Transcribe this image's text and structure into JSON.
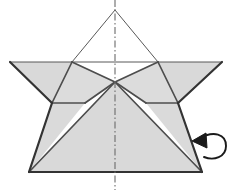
{
  "figure": {
    "title": "Origami fold diagram",
    "canvas": {
      "width": 246,
      "height": 193
    },
    "style": {
      "paper_fill": "#d9d9d9",
      "paper_fill_light": "#e2e2e2",
      "white_fill": "#ffffff",
      "outline_color": "#3a3a3a",
      "edge_color": "#4a4a4a",
      "crease_color": "#555555",
      "axis_color": "#666666",
      "arrow_color": "#1a1a1a",
      "outline_width": 2.1,
      "crease_width": 1.6,
      "thin_width": 1.0,
      "axis_width": 1.1,
      "axis_dash": "7,2.5,1.5,2.5"
    },
    "geometry": {
      "apex": [
        115,
        10
      ],
      "left_wing_tip": [
        10,
        62
      ],
      "right_wing_tip": [
        222,
        62
      ],
      "left_shoulder": [
        72,
        62
      ],
      "right_shoulder": [
        158,
        62
      ],
      "left_notch": [
        52,
        103
      ],
      "right_notch": [
        178,
        103
      ],
      "center_valley": [
        115,
        82
      ],
      "bottom_left": [
        29,
        172
      ],
      "bottom_right": [
        202,
        172
      ],
      "horizon_y": 62,
      "waist_y": 103,
      "base_y": 172,
      "axis_x": 115,
      "axis_top": 0,
      "axis_bottom": 190
    },
    "shapes": [
      {
        "name": "left-wing-panel",
        "points": "10,62 72,62 52,103",
        "fill": "#d9d9d9"
      },
      {
        "name": "right-wing-panel",
        "points": "222,62 158,62 178,103",
        "fill": "#d9d9d9"
      },
      {
        "name": "left-upper-flap",
        "points": "72,62 115,82 85,103 52,103",
        "fill": "#d9d9d9"
      },
      {
        "name": "right-upper-flap",
        "points": "158,62 115,82 146,103 178,103",
        "fill": "#d9d9d9"
      },
      {
        "name": "left-lower-panel",
        "points": "52,103 85,103 29,172",
        "fill": "#d9d9d9"
      },
      {
        "name": "right-lower-panel",
        "points": "178,103 146,103 202,172",
        "fill": "#d9d9d9"
      },
      {
        "name": "center-body-triangle",
        "points": "115,82 202,172 29,172",
        "fill": "#d9d9d9"
      },
      {
        "name": "top-white-flap",
        "points": "115,10 158,62 72,62",
        "fill": "#ffffff"
      },
      {
        "name": "center-white-notch",
        "points": "72,62 158,62 115,82",
        "fill": "#ffffff"
      }
    ],
    "creases": [
      {
        "name": "apex-left-edge",
        "from": [
          115,
          10
        ],
        "to": [
          72,
          62
        ],
        "weight": "thin"
      },
      {
        "name": "apex-right-edge",
        "from": [
          115,
          10
        ],
        "to": [
          158,
          62
        ],
        "weight": "thin"
      },
      {
        "name": "horizon-line",
        "from": [
          10,
          62
        ],
        "to": [
          222,
          62
        ],
        "weight": "thin"
      },
      {
        "name": "left-wing-lower-edge",
        "from": [
          10,
          62
        ],
        "to": [
          52,
          103
        ],
        "weight": "outline"
      },
      {
        "name": "right-wing-lower-edge",
        "from": [
          222,
          62
        ],
        "to": [
          178,
          103
        ],
        "weight": "outline"
      },
      {
        "name": "left-shoulder-to-notch",
        "from": [
          72,
          62
        ],
        "to": [
          52,
          103
        ],
        "weight": "crease"
      },
      {
        "name": "right-shoulder-to-notch",
        "from": [
          158,
          62
        ],
        "to": [
          178,
          103
        ],
        "weight": "crease"
      },
      {
        "name": "left-valley-fold",
        "from": [
          72,
          62
        ],
        "to": [
          115,
          82
        ],
        "weight": "crease"
      },
      {
        "name": "right-valley-fold",
        "from": [
          158,
          62
        ],
        "to": [
          115,
          82
        ],
        "weight": "crease"
      },
      {
        "name": "left-inner-diagonal",
        "from": [
          115,
          82
        ],
        "to": [
          85,
          103
        ],
        "weight": "crease"
      },
      {
        "name": "right-inner-diagonal",
        "from": [
          115,
          82
        ],
        "to": [
          146,
          103
        ],
        "weight": "crease"
      },
      {
        "name": "left-waist-line",
        "from": [
          52,
          103
        ],
        "to": [
          85,
          103
        ],
        "weight": "crease"
      },
      {
        "name": "right-waist-line",
        "from": [
          178,
          103
        ],
        "to": [
          146,
          103
        ],
        "weight": "crease"
      },
      {
        "name": "left-body-edge",
        "from": [
          115,
          82
        ],
        "to": [
          29,
          172
        ],
        "weight": "crease"
      },
      {
        "name": "right-body-edge",
        "from": [
          115,
          82
        ],
        "to": [
          202,
          172
        ],
        "weight": "crease"
      },
      {
        "name": "left-outer-side",
        "from": [
          52,
          103
        ],
        "to": [
          29,
          172
        ],
        "weight": "outline"
      },
      {
        "name": "right-outer-side",
        "from": [
          178,
          103
        ],
        "to": [
          202,
          172
        ],
        "weight": "outline"
      },
      {
        "name": "base-line",
        "from": [
          29,
          172
        ],
        "to": [
          202,
          172
        ],
        "weight": "outline"
      }
    ],
    "axis": {
      "name": "center-symmetry-axis",
      "from": [
        115,
        0
      ],
      "to": [
        115,
        190
      ],
      "linetype": "dash-dot"
    },
    "arrow": {
      "name": "fold-back-arrow",
      "kind": "loop-fold-arrow",
      "path": "M 198,139 C 214,130 226,134 226,146 C 226,157 214,161 204,157",
      "head_points": "206,133 192,141 207,148",
      "tip": [
        193,
        141
      ],
      "color": "#1a1a1a"
    }
  }
}
